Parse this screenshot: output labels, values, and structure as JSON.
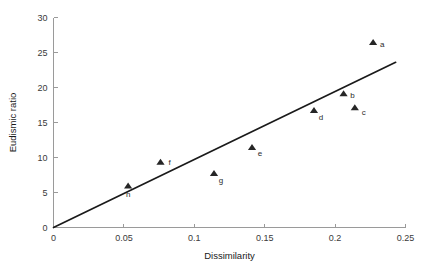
{
  "chart_data": {
    "type": "scatter",
    "title": "",
    "xlabel": "Dissimilarity",
    "ylabel": "Eudismic ratio",
    "xlim": [
      0,
      0.25
    ],
    "ylim": [
      0,
      30
    ],
    "xticks": [
      "0",
      "0.05",
      "0.1",
      "0.15",
      "0.2",
      "0.25"
    ],
    "xtick_values": [
      0,
      0.05,
      0.1,
      0.15,
      0.2,
      0.25
    ],
    "yticks": [
      "0",
      "5",
      "10",
      "15",
      "20",
      "25",
      "30"
    ],
    "ytick_values": [
      0,
      5,
      10,
      15,
      20,
      25,
      30
    ],
    "grid": false,
    "legend": "none",
    "marker": "triangle-up",
    "marker_color": "#262626",
    "points": [
      {
        "label": "a",
        "x": 0.227,
        "y": 26.4,
        "label_dx": 9,
        "label_dy": 4
      },
      {
        "label": "b",
        "x": 0.206,
        "y": 19.1,
        "label_dx": 9,
        "label_dy": 4
      },
      {
        "label": "c",
        "x": 0.214,
        "y": 17.1,
        "label_dx": 9,
        "label_dy": 7
      },
      {
        "label": "d",
        "x": 0.185,
        "y": 16.7,
        "label_dx": 7,
        "label_dy": 9
      },
      {
        "label": "e",
        "x": 0.141,
        "y": 11.4,
        "label_dx": 8,
        "label_dy": 8
      },
      {
        "label": "f",
        "x": 0.076,
        "y": 9.3,
        "label_dx": 9,
        "label_dy": 3
      },
      {
        "label": "g",
        "x": 0.114,
        "y": 7.7,
        "label_dx": 7,
        "label_dy": 9
      },
      {
        "label": "h",
        "x": 0.053,
        "y": 5.9,
        "label_dx": 0,
        "label_dy": 11
      }
    ],
    "fit_line": {
      "type": "linear",
      "x0": 0.0,
      "y0": 0.0,
      "x1": 0.243,
      "y1": 23.6
    }
  }
}
